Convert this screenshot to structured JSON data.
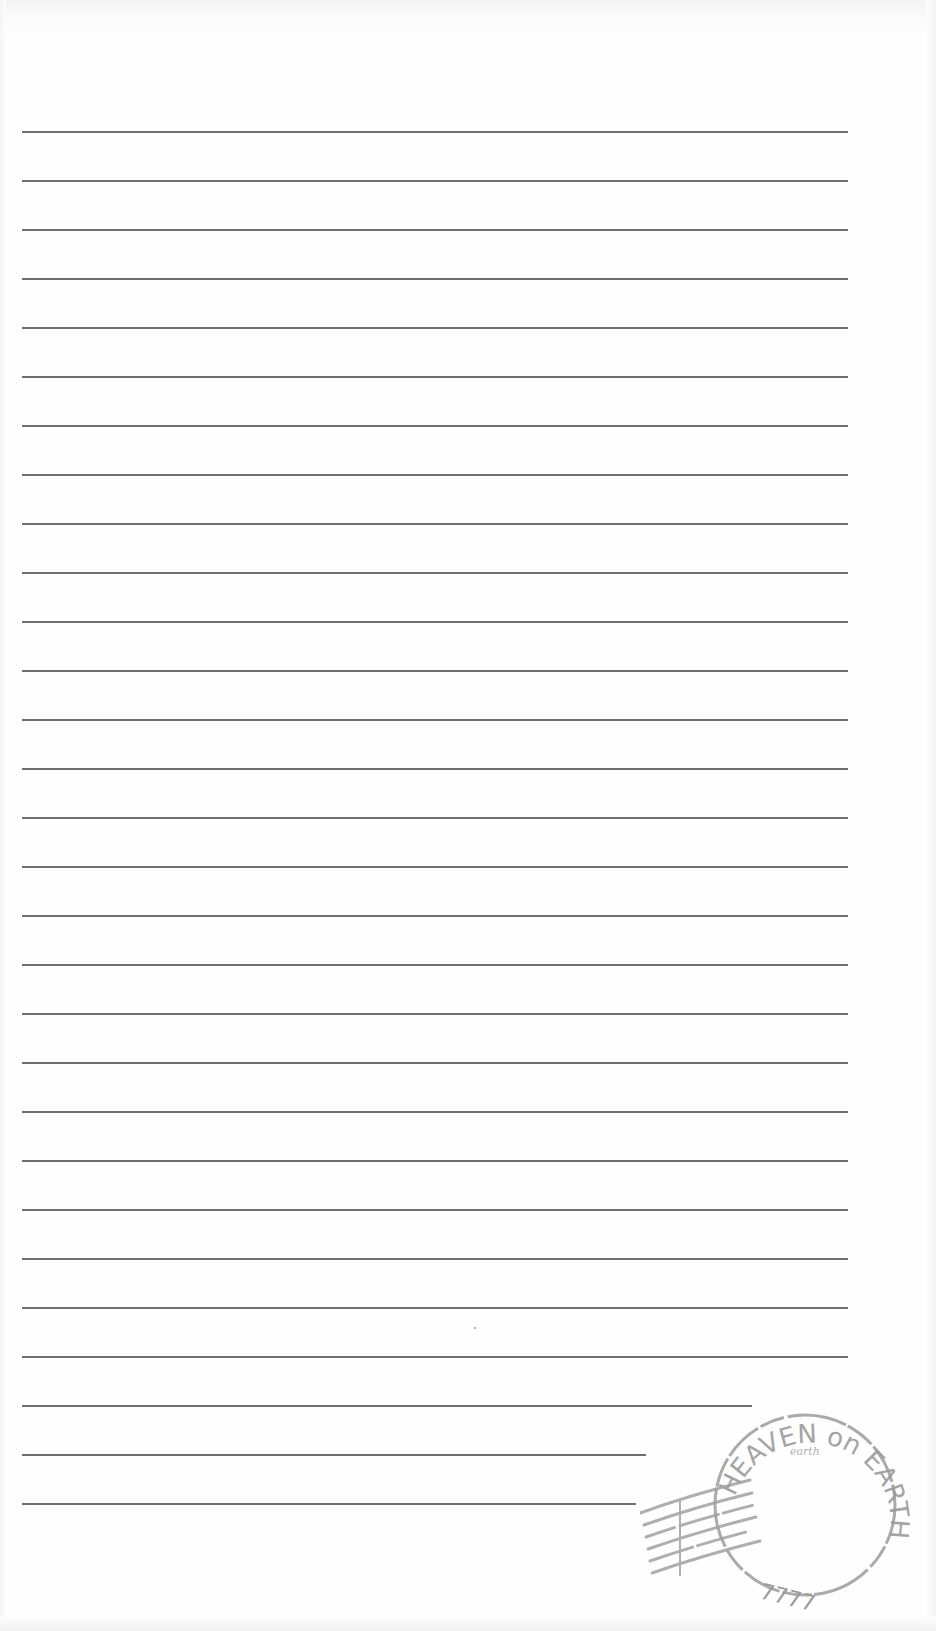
{
  "document": {
    "type": "lined-writing-paper",
    "line_color": "#5e5e5e",
    "line_count": 29,
    "line_start_x": 22,
    "line_first_y": 131,
    "line_spacing": 49,
    "lines": [
      {
        "end_x": 848
      },
      {
        "end_x": 848
      },
      {
        "end_x": 848
      },
      {
        "end_x": 848
      },
      {
        "end_x": 848
      },
      {
        "end_x": 848
      },
      {
        "end_x": 848
      },
      {
        "end_x": 848
      },
      {
        "end_x": 848
      },
      {
        "end_x": 848
      },
      {
        "end_x": 848
      },
      {
        "end_x": 848
      },
      {
        "end_x": 848
      },
      {
        "end_x": 848
      },
      {
        "end_x": 848
      },
      {
        "end_x": 848
      },
      {
        "end_x": 848
      },
      {
        "end_x": 848
      },
      {
        "end_x": 848
      },
      {
        "end_x": 848
      },
      {
        "end_x": 848
      },
      {
        "end_x": 848
      },
      {
        "end_x": 848
      },
      {
        "end_x": 848
      },
      {
        "end_x": 848
      },
      {
        "end_x": 848
      },
      {
        "end_x": 752
      },
      {
        "end_x": 646
      },
      {
        "end_x": 636
      }
    ]
  },
  "stamp": {
    "top_text": "HEAVEN on EARTH",
    "inner_text": "earth",
    "bottom_text": "7777",
    "color": "#9b9b9b"
  }
}
